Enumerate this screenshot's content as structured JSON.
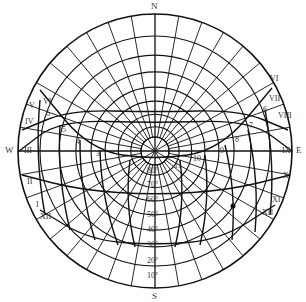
{
  "diagram": {
    "type": "sun-path-polar",
    "center": [
      155,
      151
    ],
    "radius": 137,
    "inner_radius": 14,
    "line_color": "#111111",
    "compass": {
      "north": "N",
      "south": "S",
      "east": "E",
      "west": "W"
    },
    "altitude_labels": [
      "80°",
      "70°",
      "60°",
      "50°",
      "40°",
      "30°",
      "20°",
      "10°"
    ],
    "west_month_labels": [
      "VI",
      "V",
      "IV",
      "III",
      "II",
      "I",
      "XII"
    ],
    "east_month_labels": [
      "VI",
      "VII",
      "VIII",
      "IX",
      "X",
      "XI",
      "XII"
    ],
    "west_hour_labels": [
      "6",
      "5",
      "4",
      "3"
    ],
    "east_hour_labels": [
      "6",
      "7",
      "8",
      "9",
      "10",
      "11"
    ]
  }
}
